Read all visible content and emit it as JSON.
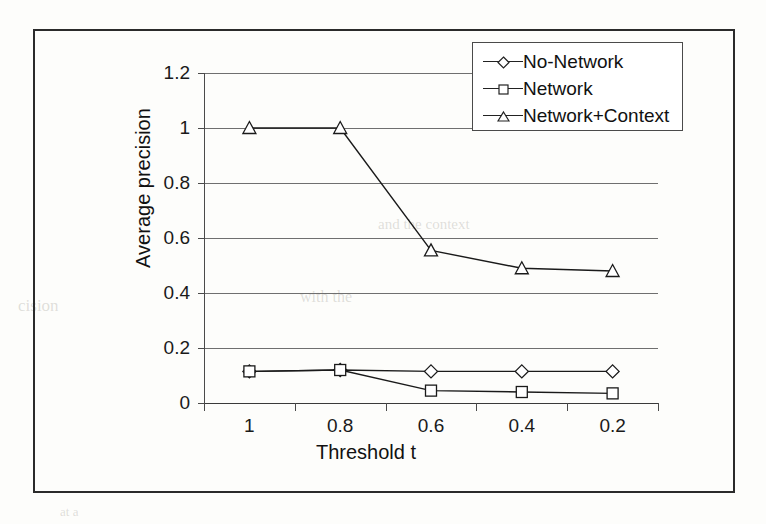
{
  "figure": {
    "ghost_text": {
      "line1": "and the context",
      "line2": "cision",
      "line3": "with the",
      "line4": "at a"
    }
  },
  "chart_data": {
    "type": "line",
    "title": "",
    "xlabel": "Threshold t",
    "ylabel": "Average precision",
    "categories": [
      "1",
      "0.8",
      "0.6",
      "0.4",
      "0.2"
    ],
    "xtick_labels": [
      "1",
      "0.8",
      "0.6",
      "0.4",
      "0.2"
    ],
    "ytick_labels": [
      "0",
      "0.2",
      "0.4",
      "0.6",
      "0.8",
      "1",
      "1.2"
    ],
    "ytick_values": [
      0,
      0.2,
      0.4,
      0.6,
      0.8,
      1,
      1.2
    ],
    "ylim": [
      0,
      1.2
    ],
    "grid": true,
    "legend_position": "top-right",
    "series": [
      {
        "name": "No-Network",
        "marker": "diamond",
        "values": [
          0.115,
          0.12,
          0.115,
          0.115,
          0.115
        ]
      },
      {
        "name": "Network",
        "marker": "square",
        "values": [
          0.115,
          0.12,
          0.045,
          0.04,
          0.035
        ]
      },
      {
        "name": "Network+Context",
        "marker": "triangle",
        "values": [
          1.0,
          1.0,
          0.555,
          0.49,
          0.48
        ]
      }
    ]
  },
  "legend": {
    "items": [
      {
        "label": "No-Network"
      },
      {
        "label": "Network"
      },
      {
        "label": "Network+Context"
      }
    ]
  }
}
